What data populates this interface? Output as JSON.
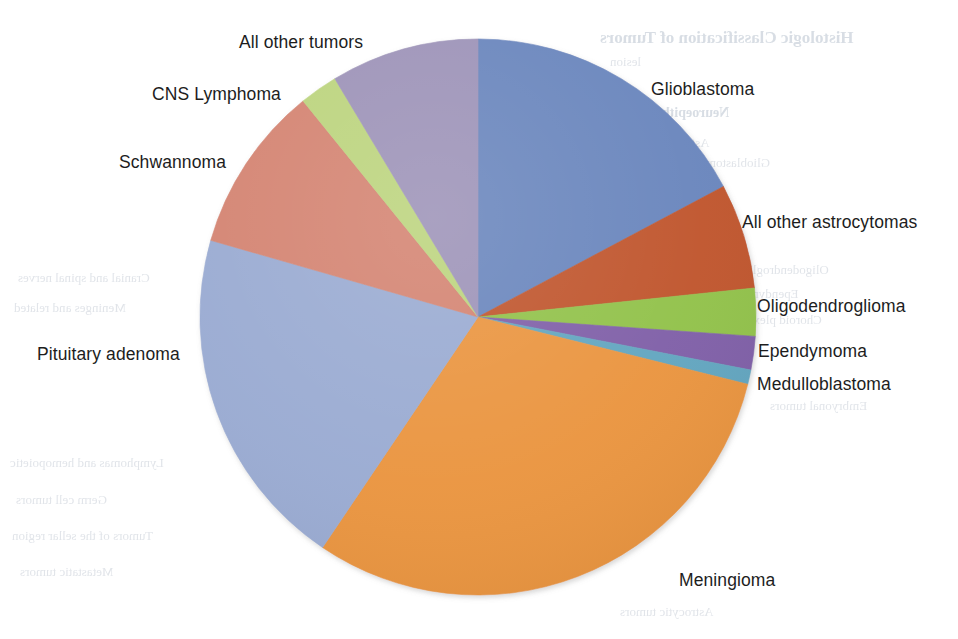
{
  "figure": {
    "background_color": "#ffffff"
  },
  "chart_data": {
    "type": "pie",
    "title": "",
    "subtitle": "",
    "xlabel": "",
    "ylabel": "",
    "grid": false,
    "legend_position": "none",
    "label_placement": "outside-callout",
    "start_angle_deg": 0,
    "direction": "clockwise",
    "units": "percent of all primary brain tumors",
    "categories": [
      "Glioblastoma",
      "All other astrocytomas",
      "Oligodendroglioma",
      "Ependymoma",
      "Medulloblastoma",
      "Meningioma",
      "Pituitary adenoma",
      "Schwannoma",
      "CNS Lymphoma",
      "All other tumors"
    ],
    "values": [
      17.2,
      6.1,
      2.8,
      1.9,
      0.9,
      30.6,
      20.0,
      9.7,
      2.2,
      8.6
    ],
    "angles_deg": [
      62,
      22,
      10,
      7,
      3,
      110,
      72,
      35,
      8,
      31
    ],
    "colors": [
      "#6b86bd",
      "#c0562d",
      "#92c24c",
      "#8061a8",
      "#63a6c0",
      "#ea9541",
      "#9aabd2",
      "#d48472",
      "#bcd47e",
      "#9d93b8"
    ],
    "slices": [
      {
        "label": "Glioblastoma",
        "value": 17.2,
        "angle_deg": 62,
        "color": "#6b86bd"
      },
      {
        "label": "All other astrocytomas",
        "value": 6.1,
        "angle_deg": 22,
        "color": "#c0562d"
      },
      {
        "label": "Oligodendroglioma",
        "value": 2.8,
        "angle_deg": 10,
        "color": "#92c24c"
      },
      {
        "label": "Ependymoma",
        "value": 1.9,
        "angle_deg": 7,
        "color": "#8061a8"
      },
      {
        "label": "Medulloblastoma",
        "value": 0.9,
        "angle_deg": 3,
        "color": "#63a6c0"
      },
      {
        "label": "Meningioma",
        "value": 30.6,
        "angle_deg": 110,
        "color": "#ea9541"
      },
      {
        "label": "Pituitary adenoma",
        "value": 20.0,
        "angle_deg": 72,
        "color": "#9aabd2"
      },
      {
        "label": "Schwannoma",
        "value": 9.7,
        "angle_deg": 35,
        "color": "#d48472"
      },
      {
        "label": "CNS Lymphoma",
        "value": 2.2,
        "angle_deg": 8,
        "color": "#bcd47e"
      },
      {
        "label": "All other tumors",
        "value": 8.6,
        "angle_deg": 31,
        "color": "#9d93b8"
      }
    ],
    "geometry": {
      "center_x": 478,
      "center_y": 317,
      "radius": 278
    }
  },
  "labels": {
    "glioblastoma": "Glioblastoma",
    "astrocytomas": "All other astrocytomas",
    "oligodendroglioma": "Oligodendroglioma",
    "ependymoma": "Ependymoma",
    "medulloblastoma": "Medulloblastoma",
    "meningioma": "Meningioma",
    "pituitary": "Pituitary adenoma",
    "schwannoma": "Schwannoma",
    "cns_lymphoma": "CNS Lymphoma",
    "all_other": "All other tumors"
  },
  "page_bleed": {
    "heading": "Histologic Classification of Tumors",
    "lines": [
      "lesion",
      "Neuroepithelial tissue",
      "Astrocytic tumors",
      "Glioblastoma",
      "Oligodendroglial",
      "Ependymal tumors",
      "Choroid plexus",
      "Embryonal tumors",
      "Cranial and spinal nerves",
      "Meninges and related",
      "Lymphomas and hemopoietic",
      "Germ cell tumors",
      "Tumors of the sellar region",
      "Metastatic tumors"
    ]
  }
}
